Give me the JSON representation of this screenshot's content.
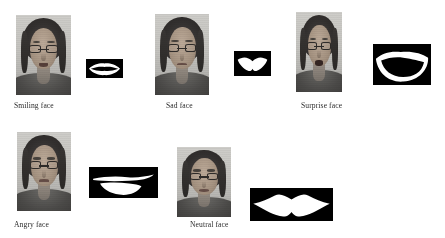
{
  "figure": {
    "background_color": "#ffffff",
    "text_color": "#2b2b2b",
    "mouth_box_color": "#000000",
    "mouth_shape_color": "#ffffff"
  },
  "items": [
    {
      "id": "smiling",
      "caption": "Smiling face",
      "photo_name": "smiling-face-photo",
      "mouth_name": "smiling-mouth-binary-image",
      "mouth_shape": "wide-closed-smile"
    },
    {
      "id": "sad",
      "caption": "Sad face",
      "photo_name": "sad-face-photo",
      "mouth_name": "sad-mouth-binary-image",
      "mouth_shape": "downturned-lips"
    },
    {
      "id": "surprise",
      "caption": "Surprise face",
      "photo_name": "surprise-face-photo",
      "mouth_name": "surprise-mouth-binary-image",
      "mouth_shape": "open-rounded-mouth"
    },
    {
      "id": "angry",
      "caption": "Angry face",
      "photo_name": "angry-face-photo",
      "mouth_name": "angry-mouth-binary-image",
      "mouth_shape": "tight-lower-lip"
    },
    {
      "id": "neutral",
      "caption": "Neutral face",
      "photo_name": "neutral-face-photo",
      "mouth_name": "neutral-mouth-binary-image",
      "mouth_shape": "straight-closed-lips"
    }
  ]
}
